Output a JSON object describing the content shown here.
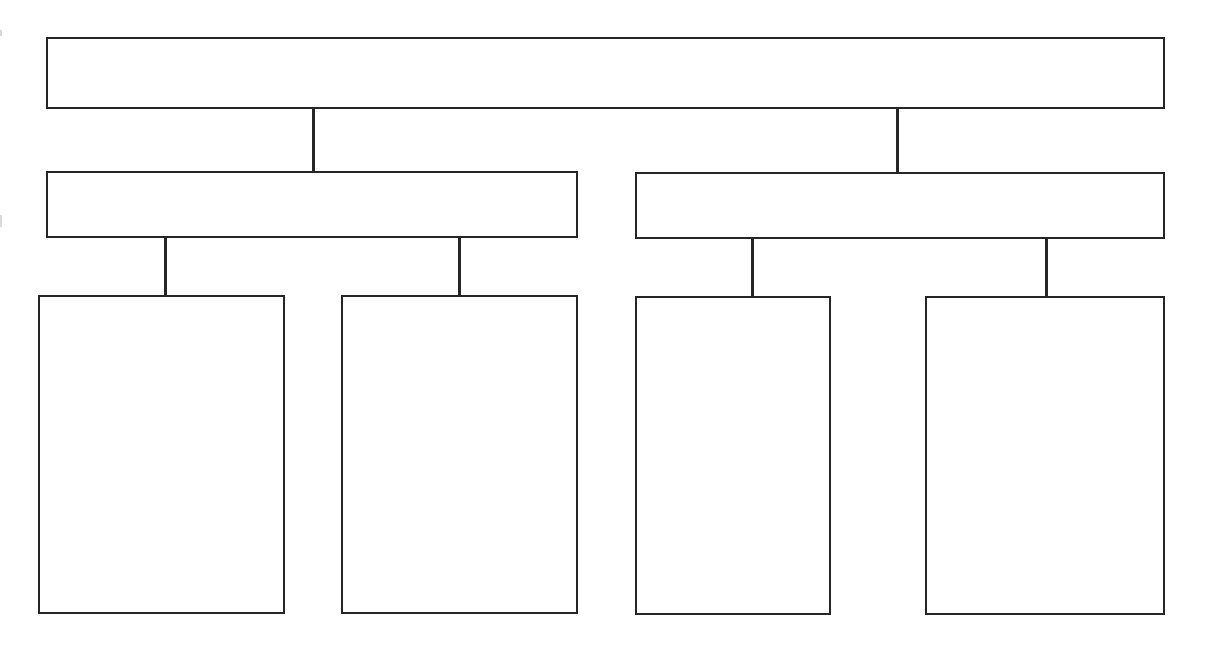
{
  "diagram": {
    "type": "hierarchy-tree",
    "line_color": "#262626",
    "background": "#ffffff",
    "root": {
      "id": "root",
      "label": "",
      "children": [
        {
          "id": "branch-left",
          "label": "",
          "children": [
            {
              "id": "leaf-1",
              "label": ""
            },
            {
              "id": "leaf-2",
              "label": ""
            }
          ]
        },
        {
          "id": "branch-right",
          "label": "",
          "children": [
            {
              "id": "leaf-3",
              "label": ""
            },
            {
              "id": "leaf-4",
              "label": ""
            }
          ]
        }
      ]
    }
  }
}
